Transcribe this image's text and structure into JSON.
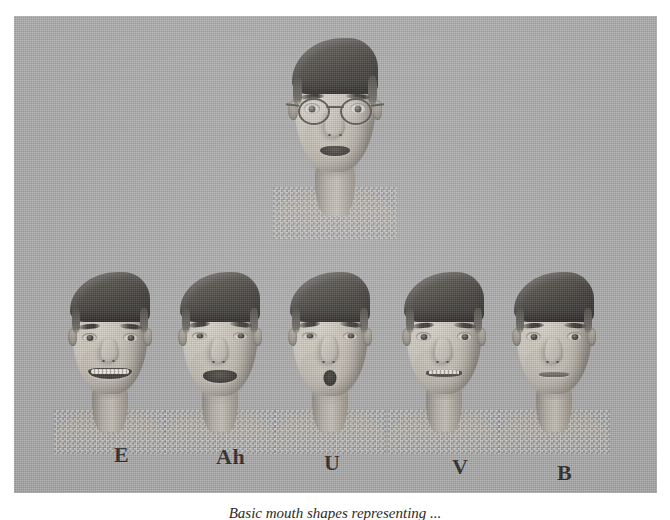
{
  "figure": {
    "kind": "scanned-figure-plate",
    "background_color": "#ababab",
    "page_background": "#ffffff",
    "top_head": {
      "name": "neutral-head-with-glasses",
      "accessory": "round wire-frame glasses",
      "hair": "dark swept-back quiff",
      "mouth_state": "slightly open"
    },
    "viseme_row": [
      {
        "id": "viseme-e",
        "label": "E",
        "mouth": "wide-grin-teeth"
      },
      {
        "id": "viseme-ah",
        "label": "Ah",
        "mouth": "open-dark"
      },
      {
        "id": "viseme-u",
        "label": "U",
        "mouth": "rounded-pursed"
      },
      {
        "id": "viseme-v",
        "label": "V",
        "mouth": "narrow-upper-teeth"
      },
      {
        "id": "viseme-b",
        "label": "B",
        "mouth": "lips-closed"
      }
    ]
  },
  "caption": {
    "text": "Basic mouth shapes representing ..."
  },
  "colors": {
    "plate_gray": "#ababab",
    "skin_light": "#d8d3c9",
    "skin_mid": "#a9a399",
    "skin_shadow": "#8b857c",
    "hair_dark": "#2e2c29",
    "label_ink": "#2b2926"
  }
}
